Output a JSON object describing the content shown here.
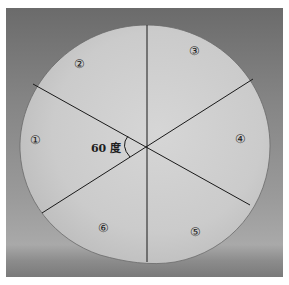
{
  "figure": {
    "center": [
      147,
      146
    ],
    "sector_labels": [
      "①",
      "②",
      "③",
      "④",
      "⑤",
      "⑥"
    ],
    "angle_label": "60 度",
    "colors": {
      "paper": "#cfcfcf",
      "line": "#1a1a1a",
      "background": "#8a8a8a"
    }
  }
}
